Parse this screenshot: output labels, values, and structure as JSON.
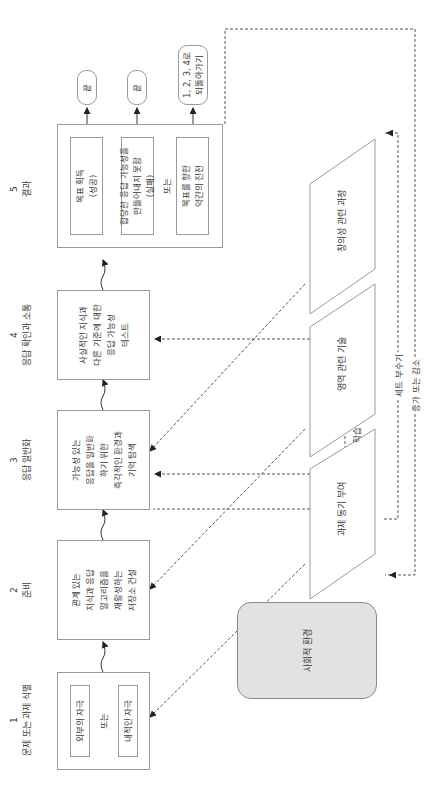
{
  "stages": [
    {
      "number": "1",
      "title": "문제 또는 과제 식별",
      "options": [
        "외부의 자극",
        "내적인 자극"
      ],
      "connector": "또는"
    },
    {
      "number": "2",
      "title": "준비",
      "body": "관계 있는\n지식과 응답\n알고리즘을\n재활성하는\n저장소 건설"
    },
    {
      "number": "3",
      "title": "응답 일반화",
      "body": "가능성 있는\n응답을 일반화\n하기 위한\n즉각적인 환경과\n기억 탐색"
    },
    {
      "number": "4",
      "title": "응답 확인과 소통",
      "body": "사실적인 지식과\n다른 기준에 대한\n응답 가능성\n테스트"
    },
    {
      "number": "5",
      "title": "결과",
      "options": [
        "목표 획득\n(성공)",
        "합당한 응답 가능성을\n만들어내지 못함\n(실패)",
        "목표를 향한\n약간의 진전"
      ],
      "connector": "또는"
    }
  ],
  "outcomes": [
    "끝",
    "끝",
    "1, 2, 3, 4로\n되돌아가기"
  ],
  "components": {
    "creativity": "창의성 관련 과정",
    "domain_skills": "영역 관련 기술",
    "task_motivation": "과제 동기 부여",
    "social_environment": "사회적 환경"
  },
  "edge_labels": {
    "learning": "학습",
    "set_breaking": "세트 부수기",
    "increase_decrease": "증가 또는 감소"
  }
}
